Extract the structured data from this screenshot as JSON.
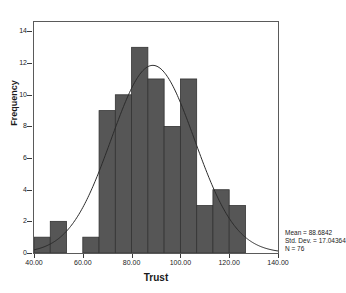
{
  "chart_data": {
    "type": "bar",
    "title": "",
    "xlabel": "Trust",
    "ylabel": "Frequency",
    "xlim": [
      40,
      140
    ],
    "ylim": [
      0,
      14.6
    ],
    "grid": false,
    "legend": "none",
    "x_ticks": [
      "40.00",
      "60.00",
      "80.00",
      "100.00",
      "120.00",
      "140.00"
    ],
    "x_tick_values": [
      40,
      60,
      80,
      100,
      120,
      140
    ],
    "y_ticks": [
      "0",
      "2",
      "4",
      "6",
      "8",
      "10",
      "12",
      "14"
    ],
    "y_tick_values": [
      0,
      2,
      4,
      6,
      8,
      10,
      12,
      14
    ],
    "bin_width": 6.6667,
    "bin_starts": [
      40,
      46.67,
      53.33,
      60,
      66.67,
      73.33,
      80,
      86.67,
      93.33,
      100,
      106.67,
      113.33,
      120
    ],
    "categories": [
      "40-46.7",
      "46.7-53.3",
      "53.3-60",
      "60-66.7",
      "66.7-73.3",
      "73.3-80",
      "80-86.7",
      "86.7-93.3",
      "93.3-100",
      "100-106.7",
      "106.7-113.3",
      "113.3-120",
      "120-126.7"
    ],
    "values": [
      1,
      2,
      0,
      1,
      9,
      10,
      13,
      11,
      8,
      11,
      3,
      4,
      3
    ],
    "bar_color": "#565656",
    "bar_edge_color": "#333333",
    "overlay": {
      "type": "normal_curve",
      "mean": 88.6842,
      "std_dev": 17.04364,
      "n": 76,
      "peak_frequency": 11.7,
      "color": "#2b2b2b"
    },
    "annotations": {
      "mean": "Mean = 88.6842",
      "std_dev": "Std. Dev. = 17.04364",
      "n": "N = 76"
    }
  },
  "axes": {
    "x_title": "Trust",
    "y_title": "Frequency"
  }
}
